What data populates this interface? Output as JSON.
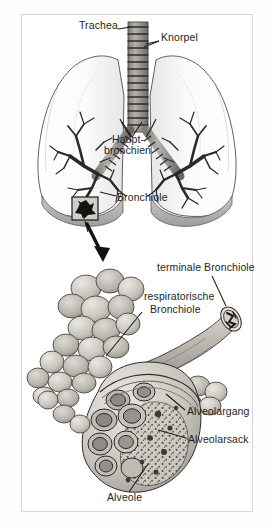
{
  "figure": {
    "language": "de",
    "style": "grayscale anatomical line drawing",
    "frame_color": "#d8d8d8",
    "background_color": "#ffffff",
    "ink_color": "#231f20"
  },
  "panels": {
    "upper": {
      "name": "Lunge mit Bronchialbaum",
      "description": "Frontalansicht beider Lungenfluegel mit Luftroehre und verzweigtem Bronchialbaum"
    },
    "lower": {
      "name": "Azinus",
      "description": "Vergroesserter Ausschnitt mit terminaler Bronchiole, respiratorischer Bronchiole, Alveolargaengen, Alveolarsaecken und Alveolen"
    }
  },
  "labels": [
    {
      "id": "trachea",
      "text": "Trachea",
      "x": 79,
      "y": 25,
      "anchor": "left"
    },
    {
      "id": "knorpel",
      "text": "Knorpel",
      "x": 161,
      "y": 37,
      "anchor": "left"
    },
    {
      "id": "hauptbronchien_line1",
      "text": "Haupt-",
      "x": 112,
      "y": 140,
      "anchor": "left"
    },
    {
      "id": "hauptbronchien_line2",
      "text": "bronchien",
      "x": 104,
      "y": 151,
      "anchor": "left"
    },
    {
      "id": "bronchiole",
      "text": "Bronchiole",
      "x": 117,
      "y": 198,
      "anchor": "left"
    },
    {
      "id": "terminale_bronchiole",
      "text": "terminale Bronchiole",
      "x": 157,
      "y": 268,
      "anchor": "left"
    },
    {
      "id": "respiratorische_line1",
      "text": "respiratorische",
      "x": 144,
      "y": 297,
      "anchor": "left"
    },
    {
      "id": "respiratorische_line2",
      "text": "Bronchiole",
      "x": 150,
      "y": 310,
      "anchor": "left"
    },
    {
      "id": "alveolargang",
      "text": "Alveolargang",
      "x": 187,
      "y": 412,
      "anchor": "left"
    },
    {
      "id": "alveolarsack",
      "text": "Alveolarsack",
      "x": 188,
      "y": 440,
      "anchor": "left"
    },
    {
      "id": "alveole",
      "text": "Alveole",
      "x": 107,
      "y": 498,
      "anchor": "left"
    }
  ],
  "callout": {
    "inset_box": "schwarzer Ausschnittrahmen am Lungenunterrand",
    "arrow": "Pfeil vom Ausschnitt zur Vergroesserung"
  }
}
